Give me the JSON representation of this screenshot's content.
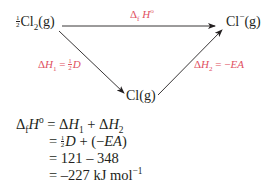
{
  "diagram": {
    "type": "Born-Haber cycle (triangle)",
    "nodes": {
      "start": {
        "coefficient": "1/2",
        "formula": "Cl",
        "subscript": "2",
        "state": "(g)"
      },
      "end": {
        "formula": "Cl",
        "superscript": "−",
        "state": "(g)"
      },
      "intermediate": {
        "formula": "Cl",
        "state": "(g)"
      }
    },
    "edges": {
      "top": {
        "label_prefix": "Δ",
        "label_sub": "f",
        "label_main": " H",
        "label_sup": "o"
      },
      "left": {
        "label_prefix": "Δ",
        "label_main": "H",
        "label_sub": "1",
        "label_eq": " = ",
        "label_coef": "1/2",
        "label_var": "D"
      },
      "right": {
        "label_prefix": "Δ",
        "label_main": "H",
        "label_sub": "2",
        "label_eq": " = −",
        "label_var": "EA"
      }
    },
    "colors": {
      "label": "#e0505f",
      "text": "#231f20",
      "arrow": "#231f20"
    }
  },
  "equations": {
    "line1": {
      "lhs_prefix": "Δ",
      "lhs_sub": "f",
      "lhs_main": "H",
      "lhs_sup": "o",
      "rhs_a": " = Δ",
      "rhs_a_var": "H",
      "rhs_a_sub": "1",
      "rhs_plus": " + Δ",
      "rhs_b_var": "H",
      "rhs_b_sub": "2"
    },
    "line2": {
      "eq": "= ",
      "coef": "1/2",
      "var": "D",
      "rest": " + (−",
      "var2": "EA",
      "close": ")"
    },
    "line3": {
      "text": "= 121 – 348"
    },
    "line4": {
      "text": "= –227 kJ mol",
      "sup": "−1"
    }
  }
}
